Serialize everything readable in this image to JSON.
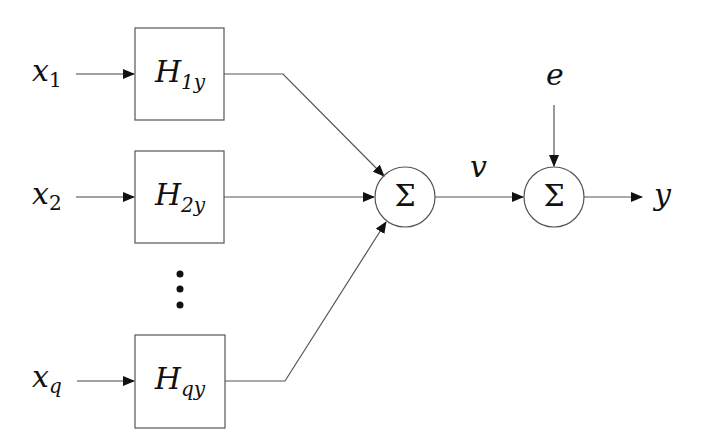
{
  "diagram": {
    "type": "block-diagram",
    "colors": {
      "line": "#555555",
      "arrow": "#111111",
      "text": "#111111",
      "background": "#ffffff"
    },
    "inputs": [
      {
        "symbol": "x",
        "subscript": "1"
      },
      {
        "symbol": "x",
        "subscript": "2"
      },
      {
        "symbol": "x",
        "subscript": "q"
      }
    ],
    "blocks": [
      {
        "symbol": "H",
        "subscript": "1y"
      },
      {
        "symbol": "H",
        "subscript": "2y"
      },
      {
        "symbol": "H",
        "subscript": "qy"
      }
    ],
    "ellipsis": "⋮",
    "summers": [
      {
        "symbol": "Σ"
      },
      {
        "symbol": "Σ"
      }
    ],
    "intermediate_signal": "v",
    "noise_signal": "e",
    "output_signal": "y"
  }
}
